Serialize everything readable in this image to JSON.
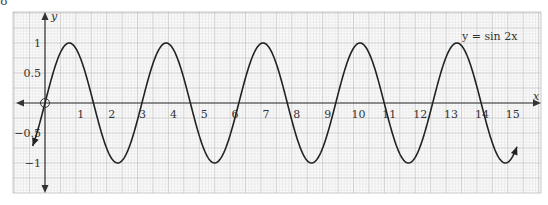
{
  "figure": {
    "label": "8"
  },
  "chart_data": {
    "type": "line",
    "title": "",
    "equation_label": "y = sin 2x",
    "xlabel": "x",
    "ylabel": "y",
    "x_ticks": [
      1,
      2,
      3,
      4,
      5,
      6,
      7,
      8,
      9,
      10,
      11,
      12,
      13,
      14,
      15
    ],
    "x_tick_labels": [
      "1",
      "2",
      "3",
      "4",
      "5",
      "6",
      "7",
      "8",
      "9",
      "10",
      "11",
      "12",
      "13",
      "14",
      "15"
    ],
    "y_ticks": [
      1,
      0.5,
      -0.5,
      -1
    ],
    "y_tick_labels": [
      "1",
      "0.5",
      "−0.5",
      "−1"
    ],
    "xlim": [
      -1,
      16
    ],
    "ylim": [
      -1.5,
      1.5
    ],
    "grid": true,
    "series": [
      {
        "name": "y = sin 2x",
        "function": "sin(2x)",
        "x_start": -0.4,
        "x_end": 15.3,
        "amplitude": 1,
        "period": 3.1416
      }
    ],
    "key_points": {
      "maxima_x": [
        0.785,
        3.927,
        7.069,
        10.21,
        13.352
      ],
      "minima_x": [
        2.356,
        5.498,
        8.639,
        11.781,
        14.923
      ],
      "zeros_x": [
        0,
        1.571,
        3.142,
        4.712,
        6.283,
        7.854,
        9.425,
        10.996,
        12.566,
        14.137
      ]
    },
    "origin_marker": "open-circle"
  },
  "colors": {
    "curve": "#222222",
    "axis": "#333333",
    "grid_minor": "#dcdcdc",
    "grid_major": "#bdbdbd"
  }
}
